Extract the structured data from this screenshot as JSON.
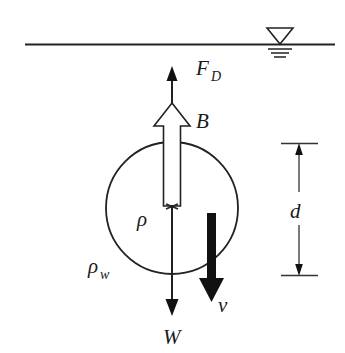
{
  "figure": {
    "background_color": "#ffffff",
    "line_color": "#222222",
    "labels": {
      "drag_force": "F",
      "drag_force_sub": "D",
      "buoyancy": "B",
      "weight": "W",
      "velocity": "v",
      "depth": "d",
      "density_sphere": "ρ",
      "density_water": "ρ",
      "density_water_sub": "w"
    },
    "icons": {
      "water_surface": "water-table-symbol",
      "drag_arrow": "thin-up-arrow",
      "buoyancy_arrow": "hollow-up-arrow",
      "weight_arrow": "thin-down-arrow",
      "velocity_arrow": "thick-down-arrow",
      "depth_dimension": "double-headed-dimension-arrow"
    },
    "geometry": {
      "water_line_y": 44,
      "water_line_x1": 25,
      "water_line_x2": 335,
      "sphere_center_x": 172,
      "sphere_center_y": 208,
      "sphere_radius": 66,
      "drag_arrow_tip_y": 68,
      "weight_arrow_tip_y": 315,
      "depth_top_y": 143,
      "depth_bottom_y": 275,
      "depth_line_x": 299
    }
  }
}
